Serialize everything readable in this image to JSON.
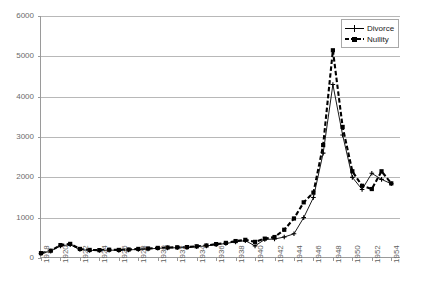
{
  "chart_data": {
    "type": "line",
    "title": "",
    "subtitle": "",
    "xlabel": "",
    "ylabel": "",
    "xlim": [
      1918,
      1955
    ],
    "ylim": [
      0,
      6000
    ],
    "grid": true,
    "legend_position": "top-right",
    "ytick_labels": [
      "0",
      "1000",
      "2000",
      "3000",
      "4000",
      "5000",
      "6000"
    ],
    "ytick_values": [
      0,
      1000,
      2000,
      3000,
      4000,
      5000,
      6000
    ],
    "xtick_labels": [
      "1918",
      "1920",
      "1922",
      "1924",
      "1926",
      "1928",
      "1930",
      "1932",
      "1934",
      "1936",
      "1938",
      "1940",
      "1942",
      "1944",
      "1946",
      "1948",
      "1950",
      "1952",
      "1954"
    ],
    "xtick_values": [
      1918,
      1920,
      1922,
      1924,
      1926,
      1928,
      1930,
      1932,
      1934,
      1936,
      1938,
      1940,
      1942,
      1944,
      1946,
      1948,
      1950,
      1952,
      1954
    ],
    "x": [
      1918,
      1919,
      1920,
      1921,
      1922,
      1923,
      1924,
      1925,
      1926,
      1927,
      1928,
      1929,
      1930,
      1931,
      1932,
      1933,
      1934,
      1935,
      1936,
      1937,
      1938,
      1939,
      1940,
      1941,
      1942,
      1943,
      1944,
      1945,
      1946,
      1947,
      1948,
      1949,
      1950,
      1951,
      1952,
      1953,
      1954
    ],
    "series": [
      {
        "name": "Divorce",
        "marker": "plus",
        "line_style": "solid",
        "color": "#000000",
        "values": [
          110,
          170,
          300,
          330,
          210,
          190,
          185,
          195,
          190,
          200,
          215,
          225,
          240,
          250,
          255,
          260,
          280,
          300,
          330,
          360,
          400,
          430,
          300,
          460,
          470,
          520,
          600,
          1000,
          1500,
          2600,
          4300,
          3050,
          2000,
          1700,
          2100,
          1950,
          1840
        ],
        "style_note": "thin solid line with small plus markers"
      },
      {
        "name": "Nullity",
        "marker": "square",
        "line_style": "dashed",
        "color": "#000000",
        "values": [
          120,
          180,
          320,
          350,
          225,
          200,
          195,
          205,
          200,
          210,
          225,
          235,
          250,
          260,
          265,
          270,
          290,
          310,
          345,
          375,
          420,
          450,
          400,
          480,
          520,
          700,
          980,
          1380,
          1620,
          2800,
          5150,
          3250,
          2150,
          1790,
          1710,
          2150,
          1850
        ],
        "style_note": "thick dashed line with square markers"
      }
    ]
  },
  "legend": {
    "items": [
      {
        "label": "Divorce",
        "swatch": "solid-plus"
      },
      {
        "label": "Nullity",
        "swatch": "dashed-square"
      }
    ]
  },
  "colors": {
    "axis": "#9a9a9a",
    "grid": "#b8b8b8",
    "ytick_text": "#6b6b6b",
    "xtick_text": "#5f5f5f",
    "series": "#000000",
    "background": "#ffffff"
  }
}
